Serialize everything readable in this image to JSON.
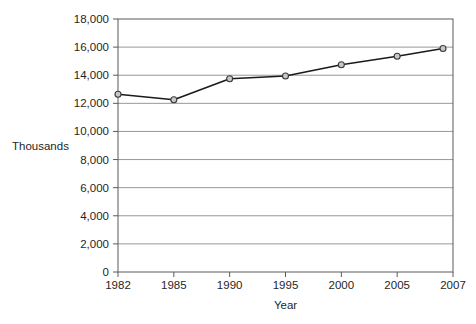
{
  "figure": {
    "type": "scanned-textbook-line-chart"
  },
  "chart_data": {
    "type": "line",
    "xlabel": "Year",
    "ylabel": "Thousands",
    "categories": [
      "1982",
      "1985",
      "1990",
      "1995",
      "2000",
      "2005",
      "2007"
    ],
    "x": [
      1982,
      1985,
      1990,
      1995,
      2000,
      2005,
      2007
    ],
    "series": [
      {
        "name": "thousands-by-year",
        "values": [
          12650,
          12250,
          13750,
          13950,
          14750,
          15350,
          15900
        ]
      }
    ],
    "ylim": [
      0,
      18000
    ],
    "y_tick_step": 2000,
    "y_tick_values": [
      0,
      2000,
      4000,
      6000,
      8000,
      10000,
      12000,
      14000,
      16000,
      18000
    ],
    "y_tick_labels": [
      "0",
      "2,000",
      "4,000",
      "6,000",
      "8,000",
      "10,000",
      "12,000",
      "14,000",
      "16,000",
      "18,000"
    ],
    "grid": true,
    "legend": false,
    "marker": "circle",
    "colors": {
      "line": "#1a1a1a",
      "marker_fill": "#c8c8c8",
      "marker_stroke": "#3a3a3a",
      "gridline": "#989898",
      "axis": "#5a5a5a",
      "text": "#1f1f1f",
      "background": "#ffffff"
    }
  }
}
